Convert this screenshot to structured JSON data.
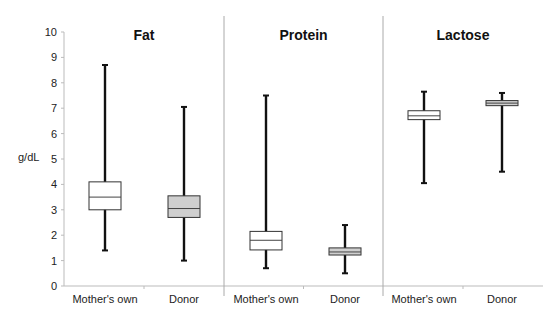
{
  "chart_data": {
    "type": "boxplot",
    "title": "",
    "ylabel": "g/dL",
    "xlabel": "",
    "ylim": [
      0,
      10
    ],
    "yticks": [
      0,
      1,
      2,
      3,
      4,
      5,
      6,
      7,
      8,
      9,
      10
    ],
    "grid": false,
    "panels": [
      {
        "title": "Fat",
        "groups": [
          {
            "name": "Mother's own",
            "min": 1.4,
            "q1": 3.0,
            "median": 3.5,
            "q3": 4.1,
            "max": 8.7,
            "fill": "#ffffff"
          },
          {
            "name": "Donor",
            "min": 1.0,
            "q1": 2.7,
            "median": 3.05,
            "q3": 3.55,
            "max": 7.05,
            "fill": "#cfcfcf"
          }
        ]
      },
      {
        "title": "Protein",
        "groups": [
          {
            "name": "Mother's own",
            "min": 0.7,
            "q1": 1.42,
            "median": 1.8,
            "q3": 2.15,
            "max": 7.5,
            "fill": "#ffffff"
          },
          {
            "name": "Donor",
            "min": 0.5,
            "q1": 1.22,
            "median": 1.34,
            "q3": 1.5,
            "max": 2.4,
            "fill": "#cfcfcf"
          }
        ]
      },
      {
        "title": "Lactose",
        "groups": [
          {
            "name": "Mother's own",
            "min": 4.05,
            "q1": 6.55,
            "median": 6.7,
            "q3": 6.9,
            "max": 7.65,
            "fill": "#ffffff"
          },
          {
            "name": "Donor",
            "min": 4.5,
            "q1": 7.1,
            "median": 7.2,
            "q3": 7.3,
            "max": 7.6,
            "fill": "#cfcfcf"
          }
        ]
      }
    ]
  }
}
